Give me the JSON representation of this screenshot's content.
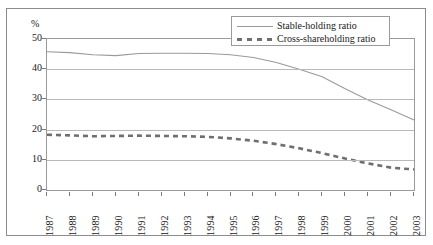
{
  "chart_data": {
    "type": "line",
    "title": "",
    "xlabel": "",
    "ylabel": "%",
    "ylim": [
      0,
      50
    ],
    "yticks": [
      0,
      10,
      20,
      30,
      40,
      50
    ],
    "grid": true,
    "legend_position": "top-right",
    "categories": [
      "1987",
      "1988",
      "1989",
      "1990",
      "1991",
      "1992",
      "1993",
      "1994",
      "1995",
      "1996",
      "1997",
      "1998",
      "1999",
      "2000",
      "2001",
      "2002",
      "2003"
    ],
    "series": [
      {
        "name": "Stable-holding ratio",
        "style": "solid",
        "color": "#9a9a9a",
        "values": [
          45.8,
          45.5,
          44.8,
          44.5,
          45.2,
          45.3,
          45.3,
          45.2,
          44.8,
          43.9,
          42.2,
          40.0,
          37.5,
          33.5,
          29.8,
          26.6,
          23.2
        ]
      },
      {
        "name": "Cross-shareholding ratio",
        "style": "dashed",
        "color": "#6f6f6f",
        "values": [
          18.3,
          18.1,
          17.8,
          17.9,
          18.0,
          17.9,
          17.8,
          17.6,
          17.1,
          16.3,
          15.2,
          13.8,
          12.2,
          10.4,
          8.8,
          7.4,
          6.8
        ]
      }
    ]
  },
  "legend": {
    "items": [
      {
        "label": "Stable-holding ratio",
        "style": "solid"
      },
      {
        "label": "Cross-shareholding ratio",
        "style": "dashed"
      }
    ]
  },
  "axis": {
    "unit": "%"
  }
}
